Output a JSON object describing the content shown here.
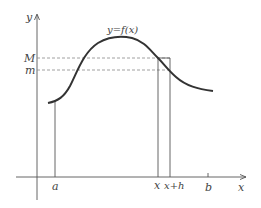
{
  "diagram": {
    "type": "function-graph",
    "curve_label": "y=f(x)",
    "axes": {
      "x_label": "x",
      "y_label": "y"
    },
    "y_levels": {
      "upper_label": "M",
      "lower_label": "m"
    },
    "x_ticks": {
      "a": "a",
      "x": "x",
      "x_plus_h": "x+h",
      "b": "b"
    },
    "colors": {
      "curve": "#333333",
      "axis": "#555555",
      "dashed": "#888888",
      "text": "#444444"
    }
  }
}
